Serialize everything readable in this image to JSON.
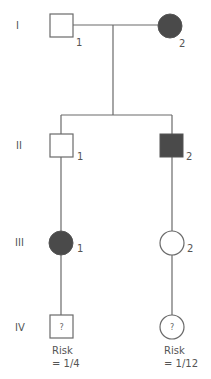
{
  "diagram": {
    "type": "pedigree",
    "colors": {
      "line": "#6a6a6a",
      "affected": "#4a4a4a",
      "unaffected": "#ffffff"
    },
    "generations": [
      {
        "label": "I"
      },
      {
        "label": "II"
      },
      {
        "label": "III"
      },
      {
        "label": "IV"
      }
    ],
    "individuals": {
      "I1": {
        "number": "1",
        "sex": "male",
        "affected": false
      },
      "I2": {
        "number": "2",
        "sex": "female",
        "affected": true
      },
      "II1": {
        "number": "1",
        "sex": "male",
        "affected": false
      },
      "II2": {
        "number": "2",
        "sex": "male",
        "affected": true
      },
      "III1": {
        "number": "1",
        "sex": "female",
        "affected": true
      },
      "III2": {
        "number": "2",
        "sex": "female",
        "affected": false
      },
      "IV1": {
        "mark": "?",
        "sex": "male",
        "risk_label": "Risk",
        "risk_value": "= 1/4"
      },
      "IV2": {
        "mark": "?",
        "sex": "female",
        "risk_label": "Risk",
        "risk_value": "= 1/12"
      }
    }
  }
}
